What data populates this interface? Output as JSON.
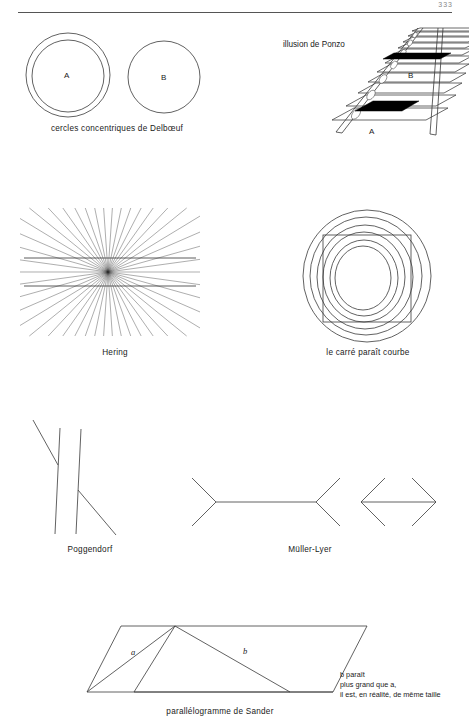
{
  "page": {
    "number": "333",
    "background": "#ffffff",
    "ink": "#3a3a3a"
  },
  "figures": [
    {
      "id": "delboeuf",
      "caption": "cercles concentriques de Delbœuf",
      "labels": [
        "A",
        "B"
      ],
      "description": "two circles of equal size; the left one (A) is surrounded by a slightly larger concentric ring"
    },
    {
      "id": "ponzo",
      "title": "illusion de Ponzo",
      "labels": [
        "A",
        "B"
      ],
      "description": "railway track in perspective with two identical black bars, the far one (B) appearing longer"
    },
    {
      "id": "hering",
      "caption": "Hering",
      "description": "two straight parallel horizontal lines crossing a radial fan of lines appear bowed"
    },
    {
      "id": "carre",
      "caption": "le carré paraît courbe",
      "description": "a square superimposed on concentric circles appears to have curved sides"
    },
    {
      "id": "poggendorf",
      "caption": "Poggendorf",
      "description": "a diagonal line interrupted by two vertical bars appears misaligned"
    },
    {
      "id": "muller-lyer",
      "caption": "Müller-Lyer",
      "description": "two equal horizontal segments, one with outward fins and one with inward fins"
    },
    {
      "id": "sander",
      "caption": "parallélogramme de Sander",
      "labels": [
        "a",
        "b"
      ],
      "note_lines": [
        "b paraît",
        "plus grand que a,",
        "il est, en réalité, de même taille"
      ],
      "description": "Sander parallelogram: diagonal b looks longer than diagonal a but both are equal"
    }
  ],
  "delboeuf": {
    "caption": "cercles concentriques de Delbœuf",
    "label_a": "A",
    "label_b": "B"
  },
  "ponzo": {
    "title": "illusion de Ponzo",
    "label_a": "A",
    "label_b": "B"
  },
  "hering": {
    "caption": "Hering"
  },
  "carre": {
    "caption": "le carré paraît courbe"
  },
  "poggendorf": {
    "caption": "Poggendorf"
  },
  "muller": {
    "caption": "Müller-Lyer"
  },
  "sander": {
    "caption": "parallélogramme de Sander",
    "label_a": "a",
    "label_b": "b",
    "note_line1": "b paraît",
    "note_line2": "plus grand que a,",
    "note_line3": "il est, en réalité, de même taille"
  }
}
